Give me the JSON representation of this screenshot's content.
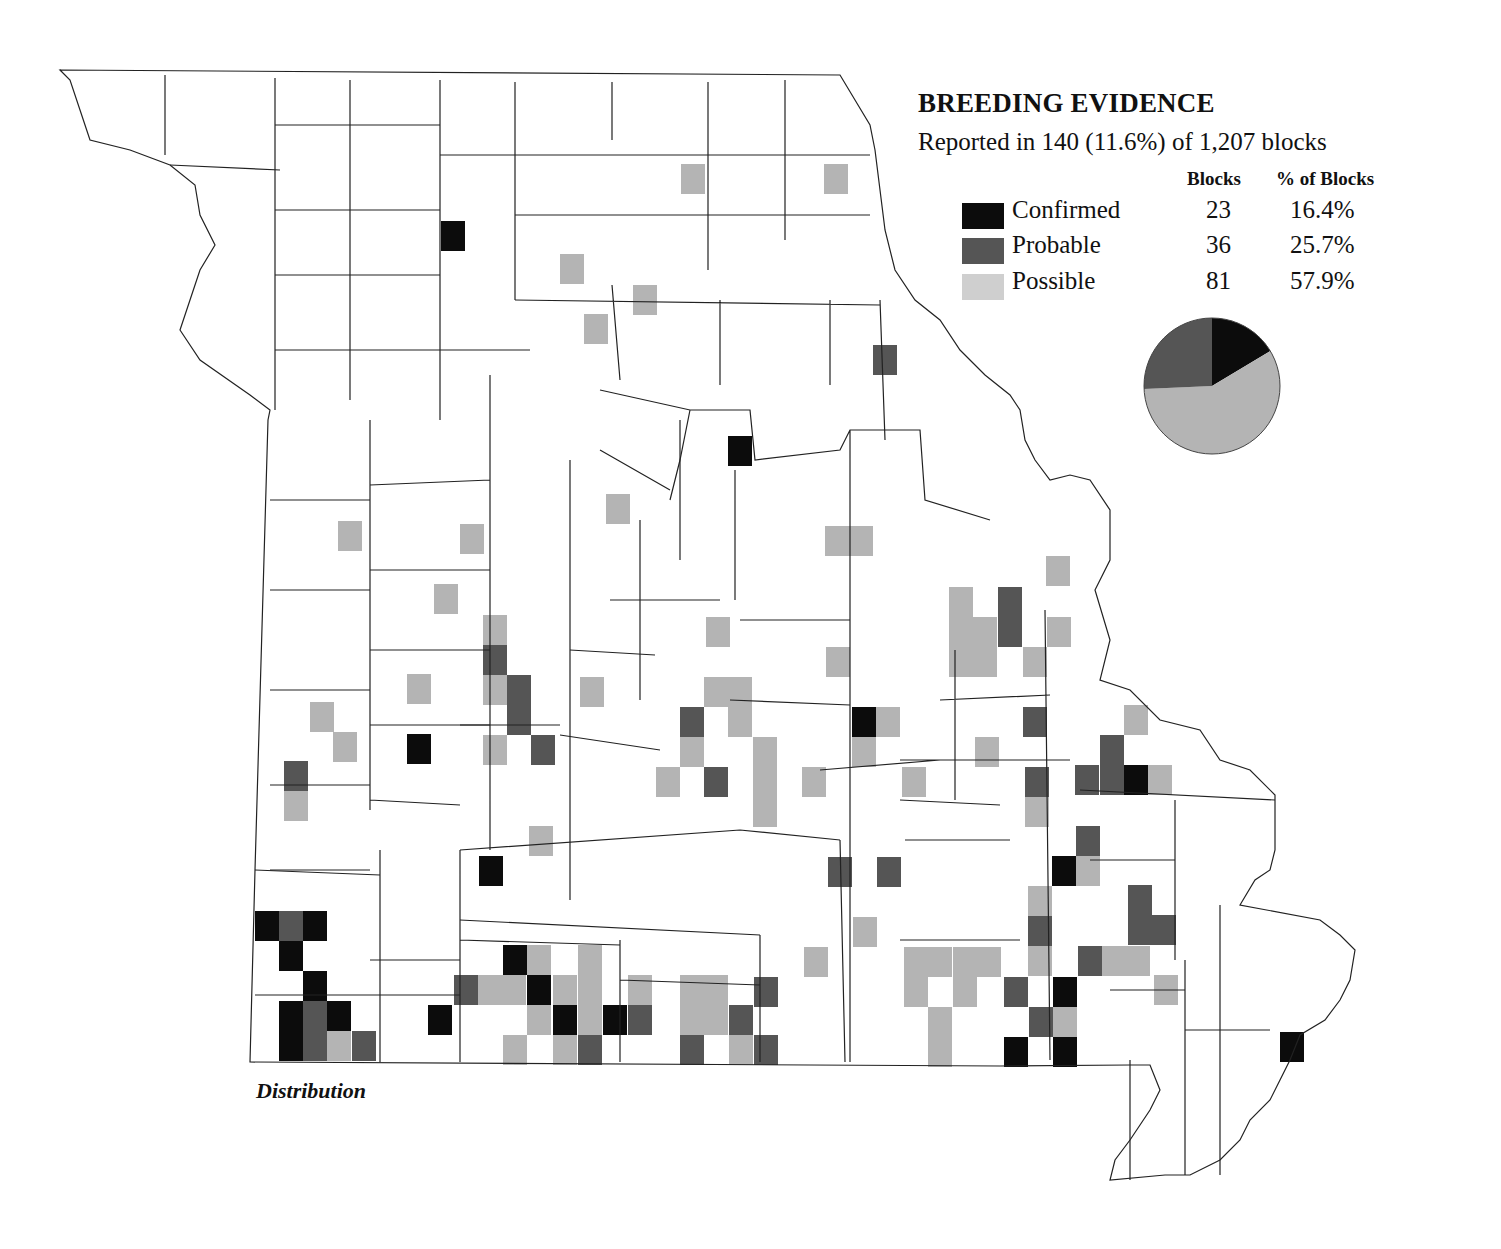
{
  "legend": {
    "title": "BREEDING EVIDENCE",
    "subtitle": "Reported in 140 (11.6%) of 1,207 blocks",
    "col_blocks": "Blocks",
    "col_pct": "% of Blocks",
    "rows": [
      {
        "label": "Confirmed",
        "blocks": "23",
        "pct": "16.4%",
        "color": "#0c0c0c"
      },
      {
        "label": "Probable",
        "blocks": "36",
        "pct": "25.7%",
        "color": "#555555"
      },
      {
        "label": "Possible",
        "blocks": "81",
        "pct": "57.9%",
        "color": "#b4b4b4"
      }
    ]
  },
  "caption": "Distribution",
  "chart_data": {
    "type": "pie",
    "title": "BREEDING EVIDENCE",
    "subtitle": "Reported in 140 (11.6%) of 1,207 blocks",
    "categories": [
      "Confirmed",
      "Probable",
      "Possible"
    ],
    "values": [
      23,
      36,
      81
    ],
    "percent": [
      16.4,
      25.7,
      57.9
    ],
    "total_blocks_reported": 140,
    "total_blocks": 1207,
    "colors": {
      "Confirmed": "#0c0c0c",
      "Probable": "#555555",
      "Possible": "#b4b4b4"
    },
    "order_clockwise_from_top": [
      "Confirmed",
      "Possible",
      "Probable"
    ]
  },
  "map": {
    "region": "Missouri",
    "block_size": [
      24,
      30
    ],
    "blocks": [
      {
        "x": 441,
        "y": 221,
        "c": "C"
      },
      {
        "x": 681,
        "y": 164,
        "c": "S"
      },
      {
        "x": 824,
        "y": 164,
        "c": "S"
      },
      {
        "x": 560,
        "y": 254,
        "c": "S"
      },
      {
        "x": 633,
        "y": 285,
        "c": "S"
      },
      {
        "x": 584,
        "y": 314,
        "c": "S"
      },
      {
        "x": 873,
        "y": 345,
        "c": "P"
      },
      {
        "x": 728,
        "y": 436,
        "c": "C"
      },
      {
        "x": 338,
        "y": 521,
        "c": "S"
      },
      {
        "x": 460,
        "y": 524,
        "c": "S"
      },
      {
        "x": 606,
        "y": 494,
        "c": "S"
      },
      {
        "x": 825,
        "y": 526,
        "c": "S"
      },
      {
        "x": 849,
        "y": 526,
        "c": "S"
      },
      {
        "x": 434,
        "y": 584,
        "c": "S"
      },
      {
        "x": 1046,
        "y": 556,
        "c": "S"
      },
      {
        "x": 949,
        "y": 587,
        "c": "S"
      },
      {
        "x": 949,
        "y": 617,
        "c": "S"
      },
      {
        "x": 973,
        "y": 617,
        "c": "S"
      },
      {
        "x": 949,
        "y": 647,
        "c": "S"
      },
      {
        "x": 973,
        "y": 647,
        "c": "S"
      },
      {
        "x": 998,
        "y": 587,
        "c": "P"
      },
      {
        "x": 998,
        "y": 617,
        "c": "P"
      },
      {
        "x": 1047,
        "y": 617,
        "c": "S"
      },
      {
        "x": 1023,
        "y": 647,
        "c": "S"
      },
      {
        "x": 483,
        "y": 615,
        "c": "S"
      },
      {
        "x": 483,
        "y": 645,
        "c": "P"
      },
      {
        "x": 483,
        "y": 675,
        "c": "S"
      },
      {
        "x": 507,
        "y": 675,
        "c": "P"
      },
      {
        "x": 507,
        "y": 705,
        "c": "P"
      },
      {
        "x": 483,
        "y": 735,
        "c": "S"
      },
      {
        "x": 531,
        "y": 735,
        "c": "P"
      },
      {
        "x": 706,
        "y": 617,
        "c": "S"
      },
      {
        "x": 580,
        "y": 677,
        "c": "S"
      },
      {
        "x": 407,
        "y": 674,
        "c": "S"
      },
      {
        "x": 826,
        "y": 647,
        "c": "S"
      },
      {
        "x": 704,
        "y": 677,
        "c": "S"
      },
      {
        "x": 728,
        "y": 677,
        "c": "S"
      },
      {
        "x": 728,
        "y": 707,
        "c": "S"
      },
      {
        "x": 680,
        "y": 707,
        "c": "P"
      },
      {
        "x": 680,
        "y": 737,
        "c": "S"
      },
      {
        "x": 656,
        "y": 767,
        "c": "S"
      },
      {
        "x": 704,
        "y": 767,
        "c": "P"
      },
      {
        "x": 753,
        "y": 737,
        "c": "S"
      },
      {
        "x": 753,
        "y": 767,
        "c": "S"
      },
      {
        "x": 753,
        "y": 797,
        "c": "S"
      },
      {
        "x": 802,
        "y": 767,
        "c": "S"
      },
      {
        "x": 852,
        "y": 707,
        "c": "C"
      },
      {
        "x": 876,
        "y": 707,
        "c": "S"
      },
      {
        "x": 852,
        "y": 737,
        "c": "S"
      },
      {
        "x": 902,
        "y": 767,
        "c": "S"
      },
      {
        "x": 310,
        "y": 702,
        "c": "S"
      },
      {
        "x": 333,
        "y": 732,
        "c": "S"
      },
      {
        "x": 407,
        "y": 734,
        "c": "C"
      },
      {
        "x": 284,
        "y": 761,
        "c": "P"
      },
      {
        "x": 284,
        "y": 791,
        "c": "S"
      },
      {
        "x": 1023,
        "y": 707,
        "c": "P"
      },
      {
        "x": 1124,
        "y": 705,
        "c": "S"
      },
      {
        "x": 975,
        "y": 737,
        "c": "S"
      },
      {
        "x": 1100,
        "y": 735,
        "c": "P"
      },
      {
        "x": 1075,
        "y": 765,
        "c": "P"
      },
      {
        "x": 1100,
        "y": 765,
        "c": "P"
      },
      {
        "x": 1124,
        "y": 765,
        "c": "C"
      },
      {
        "x": 1148,
        "y": 765,
        "c": "S"
      },
      {
        "x": 1025,
        "y": 767,
        "c": "P"
      },
      {
        "x": 1025,
        "y": 797,
        "c": "S"
      },
      {
        "x": 529,
        "y": 826,
        "c": "S"
      },
      {
        "x": 479,
        "y": 856,
        "c": "C"
      },
      {
        "x": 828,
        "y": 857,
        "c": "P"
      },
      {
        "x": 877,
        "y": 857,
        "c": "P"
      },
      {
        "x": 1076,
        "y": 826,
        "c": "P"
      },
      {
        "x": 1052,
        "y": 856,
        "c": "C"
      },
      {
        "x": 1076,
        "y": 856,
        "c": "S"
      },
      {
        "x": 853,
        "y": 917,
        "c": "S"
      },
      {
        "x": 1028,
        "y": 886,
        "c": "S"
      },
      {
        "x": 1028,
        "y": 916,
        "c": "P"
      },
      {
        "x": 1028,
        "y": 946,
        "c": "S"
      },
      {
        "x": 1128,
        "y": 885,
        "c": "P"
      },
      {
        "x": 1128,
        "y": 915,
        "c": "P"
      },
      {
        "x": 1152,
        "y": 915,
        "c": "P"
      },
      {
        "x": 1078,
        "y": 946,
        "c": "P"
      },
      {
        "x": 1102,
        "y": 946,
        "c": "S"
      },
      {
        "x": 1126,
        "y": 946,
        "c": "S"
      },
      {
        "x": 1154,
        "y": 975,
        "c": "S"
      },
      {
        "x": 804,
        "y": 947,
        "c": "S"
      },
      {
        "x": 904,
        "y": 947,
        "c": "S"
      },
      {
        "x": 928,
        "y": 947,
        "c": "S"
      },
      {
        "x": 953,
        "y": 947,
        "c": "S"
      },
      {
        "x": 977,
        "y": 947,
        "c": "S"
      },
      {
        "x": 904,
        "y": 977,
        "c": "S"
      },
      {
        "x": 953,
        "y": 977,
        "c": "S"
      },
      {
        "x": 928,
        "y": 1007,
        "c": "S"
      },
      {
        "x": 928,
        "y": 1037,
        "c": "S"
      },
      {
        "x": 1004,
        "y": 977,
        "c": "P"
      },
      {
        "x": 1053,
        "y": 977,
        "c": "C"
      },
      {
        "x": 1029,
        "y": 1007,
        "c": "P"
      },
      {
        "x": 1053,
        "y": 1007,
        "c": "S"
      },
      {
        "x": 1004,
        "y": 1037,
        "c": "C"
      },
      {
        "x": 1053,
        "y": 1037,
        "c": "C"
      },
      {
        "x": 1280,
        "y": 1032,
        "c": "C"
      },
      {
        "x": 255,
        "y": 911,
        "c": "C"
      },
      {
        "x": 279,
        "y": 911,
        "c": "P"
      },
      {
        "x": 303,
        "y": 911,
        "c": "C"
      },
      {
        "x": 279,
        "y": 941,
        "c": "C"
      },
      {
        "x": 303,
        "y": 971,
        "c": "C"
      },
      {
        "x": 279,
        "y": 1001,
        "c": "C"
      },
      {
        "x": 303,
        "y": 1001,
        "c": "P"
      },
      {
        "x": 327,
        "y": 1001,
        "c": "C"
      },
      {
        "x": 279,
        "y": 1031,
        "c": "C"
      },
      {
        "x": 303,
        "y": 1031,
        "c": "P"
      },
      {
        "x": 327,
        "y": 1031,
        "c": "S"
      },
      {
        "x": 352,
        "y": 1031,
        "c": "P"
      },
      {
        "x": 428,
        "y": 1005,
        "c": "C"
      },
      {
        "x": 454,
        "y": 975,
        "c": "P"
      },
      {
        "x": 478,
        "y": 975,
        "c": "S"
      },
      {
        "x": 502,
        "y": 975,
        "c": "S"
      },
      {
        "x": 503,
        "y": 945,
        "c": "C"
      },
      {
        "x": 527,
        "y": 945,
        "c": "S"
      },
      {
        "x": 578,
        "y": 945,
        "c": "S"
      },
      {
        "x": 527,
        "y": 975,
        "c": "C"
      },
      {
        "x": 553,
        "y": 975,
        "c": "S"
      },
      {
        "x": 578,
        "y": 975,
        "c": "S"
      },
      {
        "x": 527,
        "y": 1005,
        "c": "S"
      },
      {
        "x": 553,
        "y": 1005,
        "c": "C"
      },
      {
        "x": 578,
        "y": 1005,
        "c": "S"
      },
      {
        "x": 503,
        "y": 1035,
        "c": "S"
      },
      {
        "x": 553,
        "y": 1035,
        "c": "S"
      },
      {
        "x": 578,
        "y": 1035,
        "c": "P"
      },
      {
        "x": 603,
        "y": 1005,
        "c": "C"
      },
      {
        "x": 628,
        "y": 975,
        "c": "S"
      },
      {
        "x": 628,
        "y": 1005,
        "c": "P"
      },
      {
        "x": 680,
        "y": 975,
        "c": "S"
      },
      {
        "x": 704,
        "y": 975,
        "c": "S"
      },
      {
        "x": 680,
        "y": 1005,
        "c": "S"
      },
      {
        "x": 704,
        "y": 1005,
        "c": "S"
      },
      {
        "x": 729,
        "y": 1005,
        "c": "P"
      },
      {
        "x": 754,
        "y": 977,
        "c": "P"
      },
      {
        "x": 680,
        "y": 1035,
        "c": "P"
      },
      {
        "x": 729,
        "y": 1035,
        "c": "S"
      },
      {
        "x": 754,
        "y": 1035,
        "c": "P"
      }
    ]
  }
}
